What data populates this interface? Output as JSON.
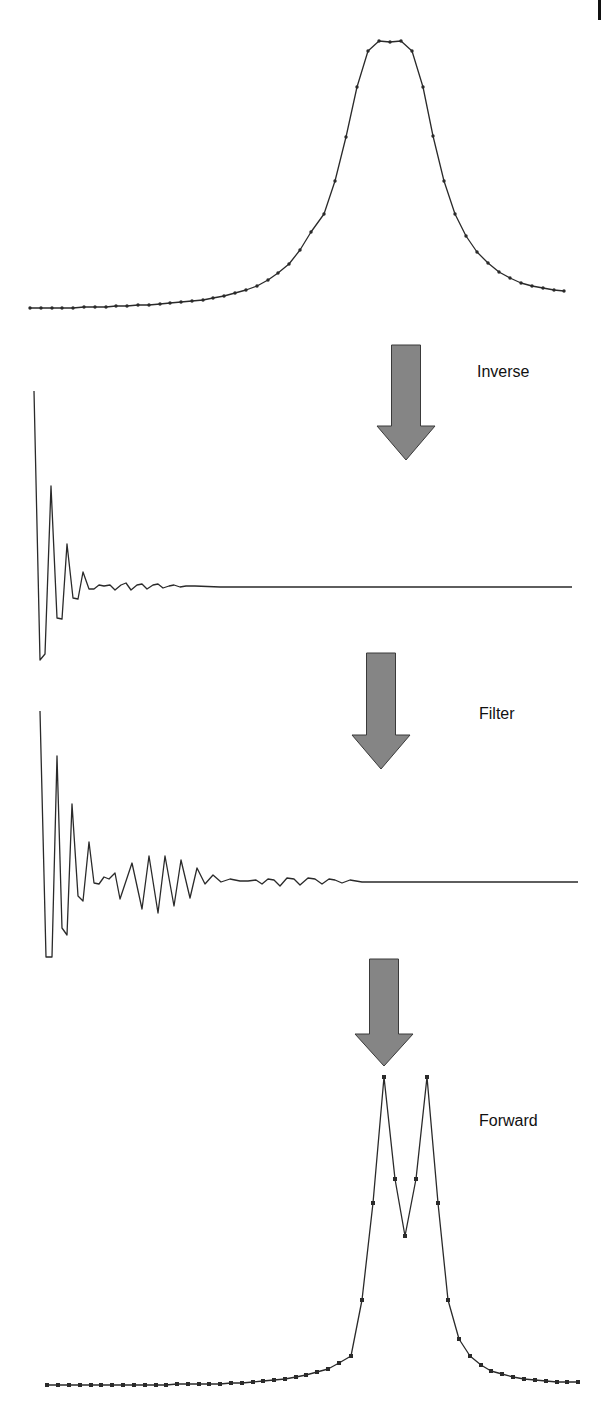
{
  "colors": {
    "line": "#2a2a2a",
    "marker": "#2a2a2a",
    "arrow_fill": "#858585",
    "arrow_stroke": "#3a3a3a",
    "label": "#111111",
    "background": "#ffffff"
  },
  "steps": [
    {
      "label": "Inverse",
      "x": 477,
      "y": 372
    },
    {
      "label": "Filter",
      "x": 479,
      "y": 714
    },
    {
      "label": "Forward",
      "x": 479,
      "y": 1121
    }
  ],
  "arrows": [
    {
      "cx": 406,
      "top": 345,
      "bottom": 460,
      "shaft_w": 29,
      "head_w": 58,
      "head_h": 34
    },
    {
      "cx": 381,
      "top": 653,
      "bottom": 769,
      "shaft_w": 29,
      "head_w": 58,
      "head_h": 34
    },
    {
      "cx": 384,
      "top": 959,
      "bottom": 1066,
      "shaft_w": 29,
      "head_w": 58,
      "head_h": 32
    }
  ],
  "chart_data": [
    {
      "type": "line",
      "title": "Original spectrum (single broadened peak)",
      "markers": "dot",
      "x_px": {
        "start": 30,
        "step": 10.75
      },
      "points": [
        [
          30,
          308
        ],
        [
          41,
          308
        ],
        [
          52,
          308
        ],
        [
          62,
          308
        ],
        [
          73,
          308
        ],
        [
          84,
          307
        ],
        [
          95,
          307
        ],
        [
          106,
          307
        ],
        [
          116,
          306
        ],
        [
          127,
          306
        ],
        [
          138,
          305
        ],
        [
          149,
          305
        ],
        [
          160,
          304
        ],
        [
          170,
          303
        ],
        [
          181,
          302
        ],
        [
          192,
          301
        ],
        [
          203,
          300
        ],
        [
          213,
          298
        ],
        [
          224,
          296
        ],
        [
          235,
          293
        ],
        [
          246,
          290
        ],
        [
          257,
          286
        ],
        [
          268,
          280
        ],
        [
          278,
          273
        ],
        [
          289,
          264
        ],
        [
          300,
          250
        ],
        [
          311,
          232
        ],
        [
          324,
          214
        ],
        [
          335,
          181
        ],
        [
          346,
          137
        ],
        [
          357,
          87
        ],
        [
          368,
          51
        ],
        [
          379,
          41
        ],
        [
          390,
          42
        ],
        [
          401,
          41
        ],
        [
          412,
          51
        ],
        [
          423,
          87
        ],
        [
          433,
          136
        ],
        [
          444,
          181
        ],
        [
          455,
          214
        ],
        [
          466,
          236
        ],
        [
          477,
          252
        ],
        [
          488,
          263
        ],
        [
          499,
          272
        ],
        [
          510,
          278
        ],
        [
          521,
          283
        ],
        [
          532,
          286
        ],
        [
          543,
          288
        ],
        [
          554,
          290
        ],
        [
          564,
          291
        ]
      ]
    },
    {
      "type": "line",
      "title": "Inverse transform (time domain)",
      "markers": "none",
      "points": [
        [
          34,
          391
        ],
        [
          40,
          660
        ],
        [
          45,
          654
        ],
        [
          51,
          486
        ],
        [
          57,
          618
        ],
        [
          62,
          619
        ],
        [
          67,
          544
        ],
        [
          73,
          598
        ],
        [
          78,
          599
        ],
        [
          83,
          572
        ],
        [
          89,
          589
        ],
        [
          94,
          589
        ],
        [
          99,
          585
        ],
        [
          104,
          586
        ],
        [
          110,
          585
        ],
        [
          115,
          590
        ],
        [
          121,
          585
        ],
        [
          126,
          583
        ],
        [
          131,
          590
        ],
        [
          137,
          585
        ],
        [
          142,
          584
        ],
        [
          147,
          589
        ],
        [
          153,
          585
        ],
        [
          158,
          584
        ],
        [
          163,
          588
        ],
        [
          169,
          586
        ],
        [
          174,
          585
        ],
        [
          180,
          587
        ],
        [
          186,
          586
        ],
        [
          195,
          586
        ],
        [
          220,
          587
        ],
        [
          260,
          587
        ],
        [
          320,
          587
        ],
        [
          400,
          587
        ],
        [
          480,
          587
        ],
        [
          572,
          587
        ]
      ]
    },
    {
      "type": "line",
      "title": "Filtered (apodized) time-domain signal",
      "markers": "none",
      "points": [
        [
          40,
          711
        ],
        [
          46,
          957
        ],
        [
          52,
          957
        ],
        [
          57,
          756
        ],
        [
          62,
          928
        ],
        [
          67,
          935
        ],
        [
          72,
          804
        ],
        [
          78,
          896
        ],
        [
          83,
          901
        ],
        [
          89,
          842
        ],
        [
          94,
          883
        ],
        [
          99,
          884
        ],
        [
          104,
          877
        ],
        [
          109,
          879
        ],
        [
          115,
          873
        ],
        [
          120,
          899
        ],
        [
          132,
          863
        ],
        [
          142,
          909
        ],
        [
          149,
          856
        ],
        [
          158,
          913
        ],
        [
          165,
          856
        ],
        [
          174,
          906
        ],
        [
          181,
          860
        ],
        [
          190,
          898
        ],
        [
          197,
          868
        ],
        [
          205,
          884
        ],
        [
          213,
          875
        ],
        [
          221,
          882
        ],
        [
          230,
          879
        ],
        [
          240,
          881
        ],
        [
          248,
          881
        ],
        [
          256,
          880
        ],
        [
          262,
          884
        ],
        [
          268,
          879
        ],
        [
          274,
          880
        ],
        [
          280,
          886
        ],
        [
          287,
          878
        ],
        [
          294,
          879
        ],
        [
          300,
          885
        ],
        [
          308,
          878
        ],
        [
          315,
          879
        ],
        [
          322,
          884
        ],
        [
          329,
          879
        ],
        [
          335,
          880
        ],
        [
          342,
          883
        ],
        [
          350,
          880
        ],
        [
          356,
          881
        ],
        [
          362,
          882
        ],
        [
          380,
          882
        ],
        [
          420,
          882
        ],
        [
          470,
          882
        ],
        [
          520,
          882
        ],
        [
          578,
          882
        ]
      ]
    },
    {
      "type": "line",
      "title": "Forward transform (resolution-enhanced doublet)",
      "markers": "square",
      "points": [
        [
          47,
          1385
        ],
        [
          58,
          1385
        ],
        [
          69,
          1385
        ],
        [
          80,
          1385
        ],
        [
          91,
          1385
        ],
        [
          101,
          1385
        ],
        [
          112,
          1385
        ],
        [
          123,
          1385
        ],
        [
          134,
          1385
        ],
        [
          145,
          1385
        ],
        [
          156,
          1385
        ],
        [
          166,
          1385
        ],
        [
          177,
          1384
        ],
        [
          188,
          1384
        ],
        [
          199,
          1384
        ],
        [
          209,
          1384
        ],
        [
          220,
          1384
        ],
        [
          231,
          1383
        ],
        [
          242,
          1383
        ],
        [
          253,
          1382
        ],
        [
          263,
          1381
        ],
        [
          274,
          1380
        ],
        [
          285,
          1379
        ],
        [
          296,
          1377
        ],
        [
          306,
          1375
        ],
        [
          317,
          1372
        ],
        [
          328,
          1369
        ],
        [
          339,
          1363
        ],
        [
          351,
          1356
        ],
        [
          362,
          1300
        ],
        [
          373,
          1203
        ],
        [
          384,
          1077
        ],
        [
          395,
          1179
        ],
        [
          405,
          1236
        ],
        [
          416,
          1179
        ],
        [
          427,
          1077
        ],
        [
          438,
          1203
        ],
        [
          448,
          1300
        ],
        [
          459,
          1339
        ],
        [
          470,
          1356
        ],
        [
          481,
          1365
        ],
        [
          491,
          1371
        ],
        [
          502,
          1374
        ],
        [
          513,
          1377
        ],
        [
          524,
          1379
        ],
        [
          535,
          1380
        ],
        [
          546,
          1381
        ],
        [
          557,
          1382
        ],
        [
          567,
          1382
        ],
        [
          578,
          1382
        ]
      ]
    }
  ]
}
